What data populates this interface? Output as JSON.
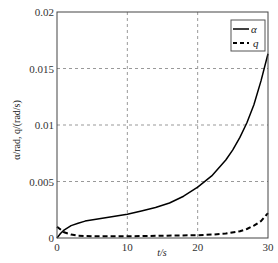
{
  "chart_data": {
    "type": "line",
    "title": "",
    "xlabel": "t/s",
    "ylabel": "α/rad, q/(rad/s)",
    "xlim": [
      0,
      30
    ],
    "ylim": [
      0,
      0.02
    ],
    "xticks": [
      0,
      10,
      20,
      30
    ],
    "xtick_labels": [
      "0",
      "10",
      "20",
      "30"
    ],
    "yticks": [
      0,
      0.005,
      0.01,
      0.015,
      0.02
    ],
    "ytick_labels": [
      "0",
      "0.005",
      "0.01",
      "0.015",
      "0.02"
    ],
    "grid": true,
    "legend_position": "upper right",
    "series": [
      {
        "name": "α",
        "style": "solid",
        "color": "#000000",
        "x": [
          0,
          0.5,
          1,
          2,
          3,
          4,
          6,
          8,
          10,
          12,
          14,
          16,
          18,
          20,
          22,
          24,
          25,
          26,
          27,
          28,
          29,
          30
        ],
        "values": [
          0,
          0.0004,
          0.0007,
          0.0011,
          0.0013,
          0.0015,
          0.0017,
          0.0019,
          0.0021,
          0.0024,
          0.0027,
          0.0031,
          0.0037,
          0.0045,
          0.0055,
          0.0069,
          0.0078,
          0.0089,
          0.0102,
          0.0118,
          0.0139,
          0.0163
        ]
      },
      {
        "name": "q",
        "style": "dashed",
        "color": "#000000",
        "x": [
          0,
          1,
          2,
          3,
          5,
          10,
          15,
          20,
          22,
          24,
          26,
          27,
          28,
          29,
          30
        ],
        "values": [
          0.001,
          0.0005,
          0.0003,
          0.0002,
          0.00015,
          0.00015,
          0.0002,
          0.00025,
          0.0003,
          0.0004,
          0.0006,
          0.0008,
          0.0011,
          0.0015,
          0.0022
        ]
      }
    ]
  },
  "legend": {
    "items": [
      {
        "label": "α",
        "style": "solid"
      },
      {
        "label": "q",
        "style": "dashed"
      }
    ]
  }
}
